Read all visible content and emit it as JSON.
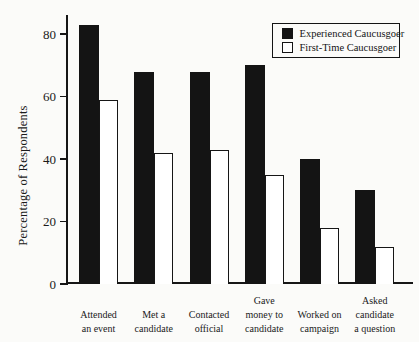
{
  "chart_data": {
    "type": "bar",
    "title": "",
    "xlabel": "",
    "ylabel": "Percentage of Respondents",
    "ylim": [
      0,
      86
    ],
    "yticks": [
      0,
      20,
      40,
      60,
      80
    ],
    "grid": false,
    "legend_position": "top-right",
    "categories": [
      "Attended an event",
      "Met a candidate",
      "Contacted official",
      "Gave money to candidate",
      "Worked on campaign",
      "Asked candidate a question"
    ],
    "category_label_lines": [
      [
        "Attended",
        "an event"
      ],
      [
        "Met a",
        "candidate"
      ],
      [
        "Contacted",
        "official"
      ],
      [
        "Gave",
        "money to",
        "candidate"
      ],
      [
        "Worked on",
        "campaign"
      ],
      [
        "Asked",
        "candidate",
        "a question"
      ]
    ],
    "series": [
      {
        "name": "Experienced Caucusgoer",
        "style": "solid-black",
        "color": "#141414",
        "values": [
          83,
          68,
          68,
          70,
          40,
          30
        ]
      },
      {
        "name": "First-Time Caucusgoer",
        "style": "white-outline",
        "color": "#ffffff",
        "values": [
          59,
          42,
          43,
          35,
          18,
          12
        ]
      }
    ]
  },
  "colors": {
    "background": "#fbfbf9",
    "bar_solid": "#141414",
    "bar_outline_fill": "#ffffff",
    "axis": "#161616"
  }
}
